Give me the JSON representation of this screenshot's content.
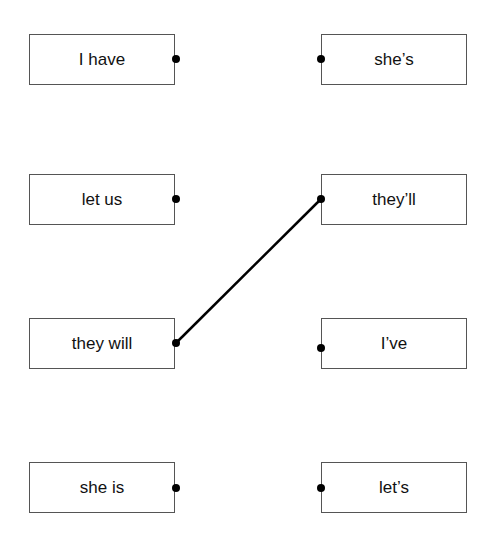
{
  "left": [
    {
      "label": "I have"
    },
    {
      "label": "let us"
    },
    {
      "label": "they will"
    },
    {
      "label": "she is"
    }
  ],
  "right": [
    {
      "label": "she’s"
    },
    {
      "label": "they’ll"
    },
    {
      "label": "I’ve"
    },
    {
      "label": "let’s"
    }
  ],
  "connections": [
    {
      "from": "they will",
      "to": "they’ll"
    }
  ]
}
